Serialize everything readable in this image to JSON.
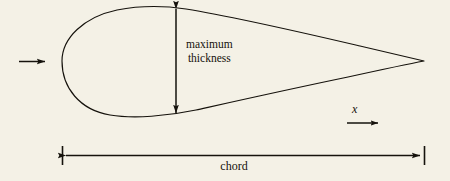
{
  "figure": {
    "name": "airfoil-cross-section-diagram",
    "background_color": "#f4f1e6",
    "line_color": "#15120c",
    "width": 450,
    "height": 181
  },
  "labels": {
    "thickness_line1": "maximum",
    "thickness_line2": "thickness",
    "chord": "chord",
    "x_axis": "x"
  },
  "annotations": {
    "freestream_arrow": "freestream-flow-arrow",
    "thickness_arrow": "maximum-thickness-double-arrow",
    "chord_arrow": "chord-dimension-double-arrow",
    "x_arrow": "x-direction-arrow",
    "leading_edge_tick": "chord-left-extension-tick",
    "trailing_edge_tick": "chord-right-extension-tick"
  },
  "geometry": {
    "leading_edge": [
      62,
      61
    ],
    "trailing_edge": [
      424,
      61
    ],
    "max_thickness_station": [
      176,
      7,
      176,
      114
    ],
    "chord_line_y": 155,
    "chord_span": [
      62,
      424
    ]
  }
}
